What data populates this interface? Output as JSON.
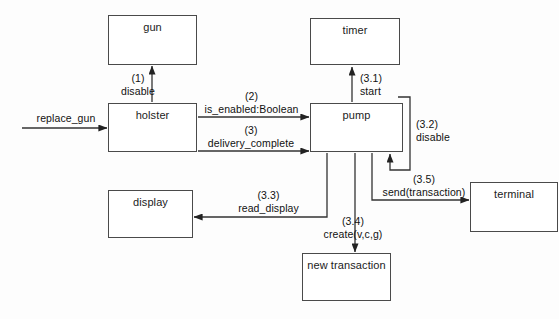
{
  "diagram": {
    "kind": "uml-collaboration-diagram",
    "background_color": "#fdfdfd",
    "line_color": "#333333",
    "box_border_color": "#4a4a4a",
    "box_fill_color": "#ffffff",
    "text_color": "#111111",
    "nodes": [
      {
        "id": "gun",
        "label": "gun",
        "x": 108,
        "y": 15,
        "w": 89,
        "h": 50
      },
      {
        "id": "timer",
        "label": "timer",
        "x": 310,
        "y": 18,
        "w": 90,
        "h": 47
      },
      {
        "id": "holster",
        "label": "holster",
        "x": 108,
        "y": 103,
        "w": 89,
        "h": 49
      },
      {
        "id": "pump",
        "label": "pump",
        "x": 310,
        "y": 103,
        "w": 93,
        "h": 49
      },
      {
        "id": "display",
        "label": "display",
        "x": 108,
        "y": 190,
        "w": 85,
        "h": 48
      },
      {
        "id": "terminal",
        "label": "terminal",
        "x": 470,
        "y": 182,
        "w": 88,
        "h": 50
      },
      {
        "id": "new_transaction",
        "label": "new transaction",
        "x": 302,
        "y": 253,
        "w": 89,
        "h": 48
      }
    ],
    "messages": [
      {
        "id": "replace_gun",
        "seq": "",
        "name": "replace_gun",
        "from": "actor",
        "to": "holster"
      },
      {
        "id": "disable_gun",
        "seq": "(1)",
        "name": "disable",
        "from": "holster",
        "to": "gun"
      },
      {
        "id": "is_enabled",
        "seq": "(2)",
        "name": "is_enabled:Boolean",
        "from": "holster",
        "to": "pump"
      },
      {
        "id": "delivery_complete",
        "seq": "(3)",
        "name": "delivery_complete",
        "from": "holster",
        "to": "pump"
      },
      {
        "id": "start_timer",
        "seq": "(3.1)",
        "name": "start",
        "from": "pump",
        "to": "timer"
      },
      {
        "id": "disable_pump",
        "seq": "(3.2)",
        "name": "disable",
        "from": "pump",
        "to": "pump"
      },
      {
        "id": "read_display",
        "seq": "(3.3)",
        "name": "read_display",
        "from": "pump",
        "to": "display"
      },
      {
        "id": "create_transaction",
        "seq": "(3.4)",
        "name": "create(v,c,g)",
        "from": "pump",
        "to": "new_transaction"
      },
      {
        "id": "send_transaction",
        "seq": "(3.5)",
        "name": "send(transaction)",
        "from": "pump",
        "to": "terminal"
      }
    ]
  }
}
